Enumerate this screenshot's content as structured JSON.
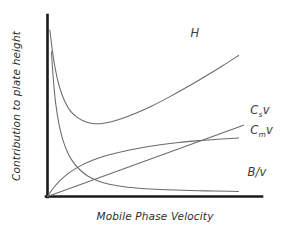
{
  "chart_data": {
    "type": "line",
    "title": "",
    "subtitle": "",
    "xlabel": "Mobile Phase Velocity",
    "ylabel": "Contribution to plate height",
    "grid": false,
    "legend_position": "inline-right-of-curve",
    "xlim": [
      0,
      1
    ],
    "ylim": [
      0,
      1
    ],
    "x_tick_labels": [],
    "y_tick_labels": [],
    "axis_style": "two-axis-L-shape-no-ticks",
    "equation": "H = B/v + C_s*v + C_m*v",
    "series": [
      {
        "name": "H",
        "label": "H",
        "label_base": "H",
        "label_sub": "",
        "label_tail": "",
        "shape": "van-deemter-sum",
        "color": "#6a6a6a",
        "minimum_x": 0.26,
        "minimum_y": 0.4,
        "points": [
          [
            0.012,
            0.915
          ],
          [
            0.025,
            0.8
          ],
          [
            0.04,
            0.7
          ],
          [
            0.06,
            0.606
          ],
          [
            0.085,
            0.53
          ],
          [
            0.115,
            0.472
          ],
          [
            0.15,
            0.436
          ],
          [
            0.19,
            0.412
          ],
          [
            0.23,
            0.401
          ],
          [
            0.27,
            0.4
          ],
          [
            0.32,
            0.409
          ],
          [
            0.38,
            0.428
          ],
          [
            0.45,
            0.457
          ],
          [
            0.53,
            0.496
          ],
          [
            0.62,
            0.546
          ],
          [
            0.71,
            0.6
          ],
          [
            0.8,
            0.657
          ],
          [
            0.89,
            0.716
          ],
          [
            0.975,
            0.775
          ]
        ]
      },
      {
        "name": "Cs_v",
        "label": "Csv",
        "label_base": "C",
        "label_sub": "s",
        "label_tail": "v",
        "shape": "linear-through-origin",
        "color": "#6a6a6a",
        "slope": 0.392,
        "points": [
          [
            0.0,
            0.0
          ],
          [
            1.0,
            0.392
          ]
        ]
      },
      {
        "name": "Cm_v",
        "label": "Cmv",
        "label_base": "C",
        "label_sub": "m",
        "label_tail": "v",
        "shape": "concave-rising-saturating",
        "color": "#6a6a6a",
        "points": [
          [
            0.0,
            0.0
          ],
          [
            0.03,
            0.047
          ],
          [
            0.065,
            0.089
          ],
          [
            0.11,
            0.13
          ],
          [
            0.165,
            0.167
          ],
          [
            0.23,
            0.199
          ],
          [
            0.305,
            0.226
          ],
          [
            0.39,
            0.249
          ],
          [
            0.48,
            0.268
          ],
          [
            0.575,
            0.284
          ],
          [
            0.67,
            0.297
          ],
          [
            0.77,
            0.307
          ],
          [
            0.87,
            0.315
          ],
          [
            0.975,
            0.322
          ]
        ]
      },
      {
        "name": "B_v",
        "label": "B/v",
        "label_base": "B/v",
        "label_sub": "",
        "label_tail": "",
        "shape": "hyperbolic-decay",
        "color": "#6a6a6a",
        "points": [
          [
            0.02,
            0.795
          ],
          [
            0.03,
            0.64
          ],
          [
            0.042,
            0.51
          ],
          [
            0.058,
            0.4
          ],
          [
            0.078,
            0.312
          ],
          [
            0.102,
            0.243
          ],
          [
            0.13,
            0.19
          ],
          [
            0.165,
            0.147
          ],
          [
            0.205,
            0.113
          ],
          [
            0.255,
            0.087
          ],
          [
            0.315,
            0.067
          ],
          [
            0.39,
            0.053
          ],
          [
            0.48,
            0.044
          ],
          [
            0.58,
            0.038
          ],
          [
            0.69,
            0.034
          ],
          [
            0.81,
            0.031
          ],
          [
            0.93,
            0.029
          ],
          [
            0.975,
            0.028
          ]
        ]
      }
    ],
    "annotations": [
      {
        "name": "label-H",
        "text": "H",
        "x": 0.73,
        "y": 0.875
      },
      {
        "name": "label-Cs-v",
        "text": "Csv",
        "x": 1.035,
        "y": 0.455
      },
      {
        "name": "label-Cm-v",
        "text": "Cmv",
        "x": 1.035,
        "y": 0.345
      },
      {
        "name": "label-B-v",
        "text": "B/v",
        "x": 1.02,
        "y": 0.11
      }
    ]
  },
  "colors": {
    "background": "#ffffff",
    "axis": "#1a1a1a",
    "curve": "#6a6a6a",
    "label_text": "#2e2e2e"
  },
  "labels": {
    "y_axis": "Contribution to plate height",
    "x_axis": "Mobile Phase Velocity",
    "curve_h": "H",
    "curve_cs_base": "C",
    "curve_cs_sub": "s",
    "curve_cs_tail": "v",
    "curve_cm_base": "C",
    "curve_cm_sub": "m",
    "curve_cm_tail": "v",
    "curve_b": "B/v"
  }
}
